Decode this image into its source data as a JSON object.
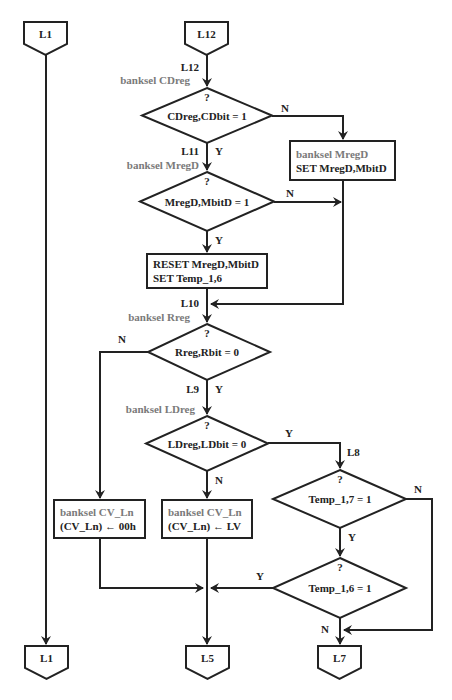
{
  "colors": {
    "stroke": "#222222",
    "text": "#222222",
    "banksel_text": "#7a7a7a",
    "background": "#ffffff"
  },
  "connectors_top": [
    {
      "id": "L1",
      "label": "L1",
      "x": 24,
      "y": 22,
      "w": 43,
      "h": 22,
      "tip": 55
    },
    {
      "id": "L12",
      "label": "L12",
      "x": 185,
      "y": 22,
      "w": 43,
      "h": 22,
      "tip": 55
    }
  ],
  "connectors_bottom": [
    {
      "id": "L1",
      "label": "L1",
      "x": 25,
      "y": 646,
      "w": 43,
      "h": 22,
      "tip": 679
    },
    {
      "id": "L5",
      "label": "L5",
      "x": 186,
      "y": 646,
      "w": 43,
      "h": 22,
      "tip": 679
    },
    {
      "id": "L7",
      "label": "L7",
      "x": 318,
      "y": 646,
      "w": 43,
      "h": 22,
      "tip": 679
    }
  ],
  "decisions": [
    {
      "id": "d1",
      "question": "?",
      "condition": "CDreg,CDbit = 1",
      "cx": 207,
      "top": 88,
      "bottom": 143,
      "left": 142,
      "right": 272
    },
    {
      "id": "d2",
      "question": "?",
      "condition": "MregD,MbitD  = 1",
      "cx": 207,
      "top": 172,
      "bottom": 231,
      "left": 140,
      "right": 274
    },
    {
      "id": "d3",
      "question": "?",
      "condition": "Rreg,Rbit = 0",
      "cx": 207,
      "top": 324,
      "bottom": 380,
      "left": 148,
      "right": 270
    },
    {
      "id": "d4",
      "question": "?",
      "condition": "LDreg,LDbit = 0",
      "cx": 207,
      "top": 416,
      "bottom": 471,
      "left": 146,
      "right": 268
    },
    {
      "id": "d5",
      "question": "?",
      "condition": "Temp_1,7  = 1",
      "cx": 340,
      "top": 470,
      "bottom": 528,
      "left": 273,
      "right": 406
    },
    {
      "id": "d6",
      "question": "?",
      "condition": "Temp_1,6  = 1",
      "cx": 340,
      "top": 558,
      "bottom": 618,
      "left": 273,
      "right": 406
    }
  ],
  "processes": [
    {
      "id": "p1",
      "x": 290,
      "y": 141,
      "w": 105,
      "h": 39,
      "lines": [
        {
          "text": "banksel MregD",
          "style": "gray"
        },
        {
          "text": "SET MregD,MbitD",
          "style": "black"
        }
      ]
    },
    {
      "id": "p2",
      "x": 147,
      "y": 254,
      "w": 120,
      "h": 34,
      "lines": [
        {
          "text": "RESET MregD,MbitD",
          "style": "black"
        },
        {
          "text": "SET Temp_1,6",
          "style": "black"
        }
      ]
    },
    {
      "id": "p3",
      "x": 54,
      "y": 500,
      "w": 91,
      "h": 38,
      "lines": [
        {
          "text": "banksel CV_Ln",
          "style": "gray"
        },
        {
          "text": "(CV_Ln) ← 00h",
          "style": "black"
        }
      ]
    },
    {
      "id": "p4",
      "x": 162,
      "y": 500,
      "w": 90,
      "h": 38,
      "lines": [
        {
          "text": "banksel CV_Ln",
          "style": "gray"
        },
        {
          "text": "(CV_Ln) ← LV",
          "style": "black"
        }
      ]
    }
  ],
  "labels": [
    {
      "text": "L12",
      "x": 199,
      "y": 71,
      "anchor": "end",
      "style": "black"
    },
    {
      "text": "banksel CDreg",
      "x": 190,
      "y": 84,
      "anchor": "end",
      "style": "gray"
    },
    {
      "text": "N",
      "x": 285,
      "y": 112,
      "anchor": "middle",
      "style": "black"
    },
    {
      "text": "L11",
      "x": 199,
      "y": 155,
      "anchor": "end",
      "style": "black"
    },
    {
      "text": "Y",
      "x": 215,
      "y": 155,
      "anchor": "start",
      "style": "black"
    },
    {
      "text": "banksel MregD",
      "x": 199,
      "y": 169,
      "anchor": "end",
      "style": "gray"
    },
    {
      "text": "N",
      "x": 290,
      "y": 197,
      "anchor": "middle",
      "style": "black"
    },
    {
      "text": "Y",
      "x": 215,
      "y": 244,
      "anchor": "start",
      "style": "black"
    },
    {
      "text": "L10",
      "x": 199,
      "y": 307,
      "anchor": "end",
      "style": "black"
    },
    {
      "text": "banksel Rreg",
      "x": 190,
      "y": 321,
      "anchor": "end",
      "style": "gray"
    },
    {
      "text": "N",
      "x": 122,
      "y": 343,
      "anchor": "middle",
      "style": "black"
    },
    {
      "text": "L9",
      "x": 199,
      "y": 393,
      "anchor": "end",
      "style": "black"
    },
    {
      "text": "Y",
      "x": 215,
      "y": 393,
      "anchor": "start",
      "style": "black"
    },
    {
      "text": "banksel LDreg",
      "x": 195,
      "y": 413,
      "anchor": "end",
      "style": "gray"
    },
    {
      "text": "Y",
      "x": 289,
      "y": 437,
      "anchor": "middle",
      "style": "black"
    },
    {
      "text": "L8",
      "x": 347,
      "y": 456,
      "anchor": "start",
      "style": "black"
    },
    {
      "text": "N",
      "x": 215,
      "y": 484,
      "anchor": "start",
      "style": "black"
    },
    {
      "text": "N",
      "x": 418,
      "y": 493,
      "anchor": "middle",
      "style": "black"
    },
    {
      "text": "Y",
      "x": 348,
      "y": 541,
      "anchor": "start",
      "style": "black"
    },
    {
      "text": "Y",
      "x": 260,
      "y": 580,
      "anchor": "middle",
      "style": "black"
    },
    {
      "text": "N",
      "x": 329,
      "y": 633,
      "anchor": "end",
      "style": "black"
    }
  ],
  "edges": [
    {
      "id": "e-L1-through",
      "points": [
        [
          46,
          55
        ],
        [
          46,
          644
        ]
      ],
      "arrow": true
    },
    {
      "id": "e-L12-d1",
      "points": [
        [
          207,
          55
        ],
        [
          207,
          86
        ]
      ],
      "arrow": true
    },
    {
      "id": "e-d1-N-p1",
      "points": [
        [
          272,
          116
        ],
        [
          343,
          116
        ],
        [
          343,
          139
        ]
      ],
      "arrow": true
    },
    {
      "id": "e-d1-Y-d2",
      "points": [
        [
          207,
          143
        ],
        [
          207,
          170
        ]
      ],
      "arrow": true
    },
    {
      "id": "e-d2-N-merge",
      "points": [
        [
          274,
          202
        ],
        [
          341,
          202
        ]
      ],
      "arrow": true
    },
    {
      "id": "e-p1-down",
      "points": [
        [
          343,
          180
        ],
        [
          343,
          304
        ],
        [
          211,
          304
        ]
      ],
      "arrow": true
    },
    {
      "id": "e-d2-Y-p2",
      "points": [
        [
          207,
          231
        ],
        [
          207,
          252
        ]
      ],
      "arrow": true
    },
    {
      "id": "e-p2-d3",
      "points": [
        [
          207,
          288
        ],
        [
          207,
          322
        ]
      ],
      "arrow": true
    },
    {
      "id": "e-d3-N-p3",
      "points": [
        [
          148,
          352
        ],
        [
          100,
          352
        ],
        [
          100,
          498
        ]
      ],
      "arrow": true
    },
    {
      "id": "e-d3-Y-d4",
      "points": [
        [
          207,
          380
        ],
        [
          207,
          414
        ]
      ],
      "arrow": true
    },
    {
      "id": "e-d4-N-p4",
      "points": [
        [
          207,
          471
        ],
        [
          207,
          498
        ]
      ],
      "arrow": true
    },
    {
      "id": "e-d4-Y-d5",
      "points": [
        [
          268,
          443
        ],
        [
          340,
          443
        ],
        [
          340,
          468
        ]
      ],
      "arrow": true
    },
    {
      "id": "e-d5-Y-d6",
      "points": [
        [
          340,
          528
        ],
        [
          340,
          556
        ]
      ],
      "arrow": true
    },
    {
      "id": "e-d5-N-L7",
      "points": [
        [
          406,
          499
        ],
        [
          432,
          499
        ],
        [
          432,
          630
        ],
        [
          344,
          630
        ]
      ],
      "arrow": true
    },
    {
      "id": "e-p3-merge",
      "points": [
        [
          100,
          538
        ],
        [
          100,
          588
        ],
        [
          203,
          588
        ]
      ],
      "arrow": true
    },
    {
      "id": "e-d6-Y-merge",
      "points": [
        [
          273,
          588
        ],
        [
          211,
          588
        ]
      ],
      "arrow": true
    },
    {
      "id": "e-p4-L5",
      "points": [
        [
          207,
          538
        ],
        [
          207,
          644
        ]
      ],
      "arrow": true
    },
    {
      "id": "e-d6-N-L7",
      "points": [
        [
          340,
          618
        ],
        [
          340,
          644
        ]
      ],
      "arrow": true
    }
  ]
}
